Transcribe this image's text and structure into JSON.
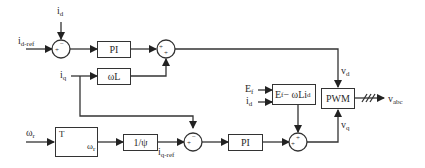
{
  "diagram": {
    "type": "control block diagram",
    "inputs": {
      "id_ref": {
        "main": "i",
        "sub": "d-ref"
      },
      "id": {
        "main": "i",
        "sub": "d"
      },
      "iq": {
        "main": "i",
        "sub": "q"
      },
      "omega_r": {
        "main": "ω",
        "sub": "r"
      },
      "Ef": {
        "main": "E",
        "sub": "f"
      },
      "id2": {
        "main": "i",
        "sub": "d"
      }
    },
    "blocks": {
      "pi_d": "PI",
      "omega_l": "ωL",
      "torque_curve": {
        "y_axis": "T",
        "x_axis_main": "ω",
        "x_axis_sub": "r"
      },
      "inv_psi": "1/ψ",
      "pi_q": "PI",
      "ef_block": {
        "text": "E",
        "sub1": "f",
        "mid": " − ωLi",
        "sub2": "d"
      },
      "pwm": "PWM"
    },
    "signals": {
      "iq_ref": {
        "main": "i",
        "sub": "q-ref"
      },
      "vd": {
        "main": "v",
        "sub": "d"
      },
      "vq": {
        "main": "v",
        "sub": "q"
      },
      "vabc": {
        "main": "v",
        "sub": "abc"
      }
    },
    "summing_signs": {
      "sum1_left": "+",
      "sum1_top": "−",
      "sum2_left": "+",
      "sum2_bottom": "+",
      "sum3_left": "+",
      "sum3_top": "−",
      "sum4_left": "+",
      "sum4_top": "+"
    }
  }
}
